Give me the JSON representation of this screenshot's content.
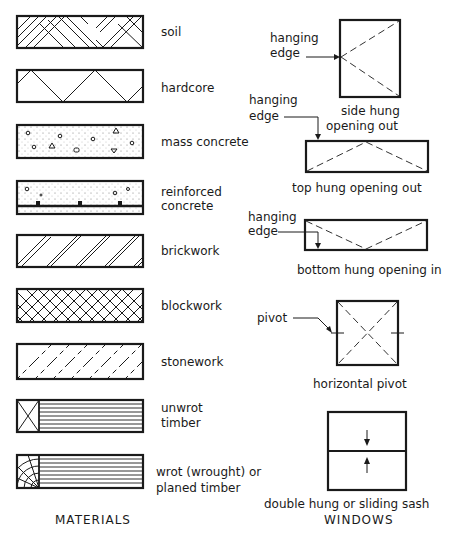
{
  "materials": {
    "heading": "MATERIALS",
    "items": [
      {
        "label": [
          "soil"
        ]
      },
      {
        "label": [
          "hardcore"
        ]
      },
      {
        "label": [
          "mass concrete"
        ]
      },
      {
        "label": [
          "reinforced",
          "concrete"
        ]
      },
      {
        "label": [
          "brickwork"
        ]
      },
      {
        "label": [
          "blockwork"
        ]
      },
      {
        "label": [
          "stonework"
        ]
      },
      {
        "label": [
          "unwrot",
          "timber"
        ]
      },
      {
        "label": [
          "wrot (wrought) or",
          "planed timber"
        ]
      }
    ]
  },
  "windows": {
    "heading": "WINDOWS",
    "items": [
      {
        "caption": [
          "side hung",
          "opening out"
        ],
        "callout": [
          "hanging",
          "edge"
        ]
      },
      {
        "caption": [
          "top hung  opening out"
        ],
        "callout": [
          "hanging",
          "edge"
        ]
      },
      {
        "caption": [
          "bottom hung opening in"
        ],
        "callout": [
          "hanging",
          "edge"
        ]
      },
      {
        "caption": [
          "horizontal pivot"
        ],
        "callout": [
          "pivot"
        ]
      },
      {
        "caption": [
          "double hung or sliding sash"
        ]
      }
    ]
  }
}
